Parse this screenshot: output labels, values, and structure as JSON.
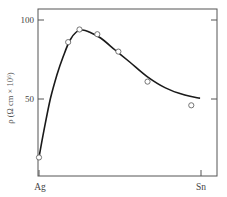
{
  "chart_data": {
    "type": "line",
    "title": "",
    "xlabel": "",
    "ylabel": "ρ (Ω cm × 10⁶)",
    "x_endpoints": [
      "Ag",
      "Sn"
    ],
    "x_range": [
      0,
      1
    ],
    "x_unit": "fraction Sn (Ag → Sn)",
    "ylim": [
      0,
      105
    ],
    "yticks": [
      {
        "value": 100,
        "label": "100"
      },
      {
        "value": 50,
        "label": "50"
      }
    ],
    "grid": false,
    "legend": null,
    "series": [
      {
        "name": "measured",
        "kind": "scatter",
        "marker": "open-circle",
        "x": [
          0.0,
          0.18,
          0.25,
          0.36,
          0.49,
          0.67,
          0.94
        ],
        "y": [
          13,
          86,
          94,
          91,
          80,
          61,
          46
        ]
      },
      {
        "name": "fitted curve",
        "kind": "line",
        "x": [
          0.0,
          0.03,
          0.07,
          0.11,
          0.15,
          0.19,
          0.23,
          0.27,
          0.31,
          0.38,
          0.47,
          0.56,
          0.67,
          0.78,
          0.9,
          0.99
        ],
        "y": [
          13,
          30,
          50,
          65,
          77,
          87,
          92.4,
          93.7,
          92.4,
          88.6,
          81,
          73.4,
          64,
          57,
          52.5,
          50.6
        ]
      }
    ],
    "colors": {
      "axis": "#555555",
      "curve": "#1a1a1a",
      "marker": "#666666"
    }
  }
}
